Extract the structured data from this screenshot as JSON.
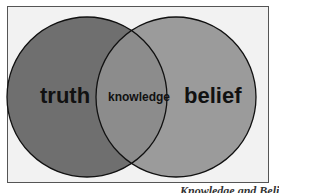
{
  "diagram": {
    "type": "venn",
    "sets": [
      {
        "label": "truth",
        "color": "#6e6e6e"
      },
      {
        "label": "belief",
        "color": "#9a9a9a"
      }
    ],
    "intersection": {
      "label": "knowledge",
      "color": "#8a8a8a"
    },
    "background": "#f2f2f2"
  },
  "caption": "Knowledge and Belief"
}
